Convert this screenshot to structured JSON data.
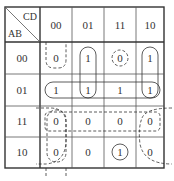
{
  "kmap": {
    "row_var": "AB",
    "col_var": "CD",
    "col_labels": [
      "00",
      "01",
      "11",
      "10"
    ],
    "row_labels": [
      "00",
      "01",
      "11",
      "10"
    ],
    "cells": [
      [
        "0",
        "1",
        "0",
        "1"
      ],
      [
        "1",
        "1",
        "1",
        "1"
      ],
      [
        "0",
        "0",
        "0",
        "0"
      ],
      [
        "0",
        "0",
        "1",
        "0"
      ]
    ]
  }
}
